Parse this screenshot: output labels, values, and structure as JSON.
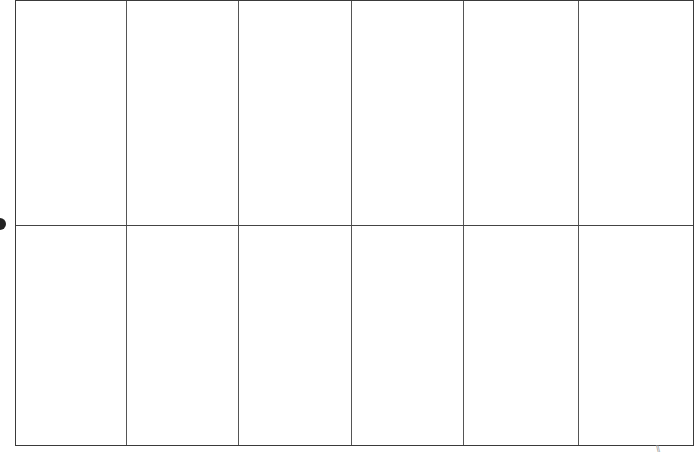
{
  "grid": {
    "columns": 6,
    "rows": 2,
    "vertical_lines_x": [
      126,
      238,
      351,
      463,
      578
    ],
    "horizontal_line_y": 225,
    "border_color": "#3a3a3a",
    "line_color": "#555555"
  },
  "edge_marks": {
    "left_marker": "half-dot",
    "bottom_right_mark": "\\\\"
  }
}
